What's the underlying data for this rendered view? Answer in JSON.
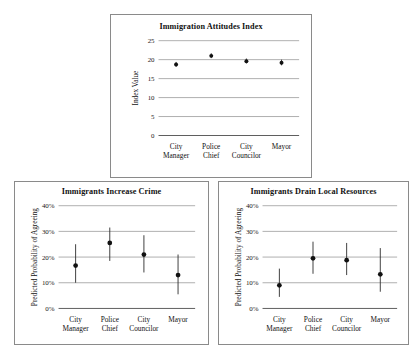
{
  "figure": {
    "background": "#ffffff",
    "panel_border_color": "#8a8a8a",
    "marker_color": "#111111",
    "gridline_color": "#8c8c8c"
  },
  "panels": [
    {
      "id": "immigration-attitudes-index",
      "title": "Immigration Attitudes Index"
    },
    {
      "id": "immigrants-increase-crime",
      "title": "Immigrants Increase Crime"
    },
    {
      "id": "immigrants-drain-local-resources",
      "title": "Immigrants Drain Local Resources"
    }
  ],
  "chart_data": [
    {
      "type": "scatter",
      "title": "Immigration Attitudes Index",
      "xlabel": "",
      "ylabel": "Index Value",
      "ylim": [
        0,
        25
      ],
      "yticks": [
        0,
        5,
        10,
        15,
        20,
        25
      ],
      "ytick_labels": [
        "0",
        "5",
        "10",
        "15",
        "20",
        "25"
      ],
      "grid": true,
      "legend": "none",
      "categories": [
        "City Manager",
        "Police Chief",
        "City Councilor",
        "Mayor"
      ],
      "category_lines": [
        [
          "City",
          "Manager"
        ],
        [
          "Police",
          "Chief"
        ],
        [
          "City",
          "Councilor"
        ],
        [
          "Mayor"
        ]
      ],
      "values": [
        18.7,
        21.0,
        19.6,
        19.2
      ],
      "ci_low": [
        18.1,
        20.4,
        19.0,
        18.5
      ],
      "ci_high": [
        19.4,
        21.7,
        20.3,
        20.0
      ]
    },
    {
      "type": "scatter",
      "title": "Immigrants Increase Crime",
      "xlabel": "",
      "ylabel": "Predicted Probability of Agreeing",
      "ylim": [
        0,
        40
      ],
      "yticks": [
        0,
        10,
        20,
        30,
        40
      ],
      "ytick_labels": [
        "0%",
        "10%",
        "20%",
        "30%",
        "40%"
      ],
      "grid": true,
      "legend": "none",
      "categories": [
        "City Manager",
        "Police Chief",
        "City Councilor",
        "Mayor"
      ],
      "category_lines": [
        [
          "City",
          "Manager"
        ],
        [
          "Police",
          "Chief"
        ],
        [
          "City",
          "Councilor"
        ],
        [
          "Mayor"
        ]
      ],
      "values": [
        16.7,
        25.5,
        21.0,
        13.0
      ],
      "ci_low": [
        10.0,
        18.5,
        14.0,
        5.5
      ],
      "ci_high": [
        25.0,
        31.5,
        28.5,
        21.0
      ]
    },
    {
      "type": "scatter",
      "title": "Immigrants Drain Local Resources",
      "xlabel": "",
      "ylabel": "Predicted Probability of Agreeing",
      "ylim": [
        0,
        40
      ],
      "yticks": [
        0,
        10,
        20,
        30,
        40
      ],
      "ytick_labels": [
        "0%",
        "10%",
        "20%",
        "30%",
        "40%"
      ],
      "grid": true,
      "legend": "none",
      "categories": [
        "City Manager",
        "Police Chief",
        "City Councilor",
        "Mayor"
      ],
      "category_lines": [
        [
          "City",
          "Manager"
        ],
        [
          "Police",
          "Chief"
        ],
        [
          "City",
          "Councilor"
        ],
        [
          "Mayor"
        ]
      ],
      "values": [
        9.0,
        19.5,
        18.8,
        13.3
      ],
      "ci_low": [
        4.5,
        13.5,
        13.0,
        6.5
      ],
      "ci_high": [
        15.5,
        26.0,
        25.5,
        23.5
      ]
    }
  ]
}
